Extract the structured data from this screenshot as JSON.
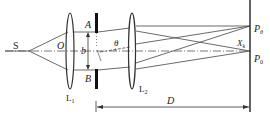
{
  "diagram": {
    "type": "optics-double-slit-setup",
    "labels": {
      "source": "S",
      "lens1_center": "O",
      "lens1": "L",
      "lens1_sub": "1",
      "lens2": "L",
      "lens2_sub": "2",
      "slit_top": "A",
      "slit_bottom": "B",
      "slit_separation": "b",
      "angle": "θ",
      "point_theta": "P",
      "point_theta_sub": "θ",
      "point_zero": "P",
      "point_zero_sub": "0",
      "crossing": "X",
      "crossing_sub": "k",
      "distance": "D"
    },
    "colors": {
      "line": "#333333",
      "background": "#ffffff"
    }
  }
}
